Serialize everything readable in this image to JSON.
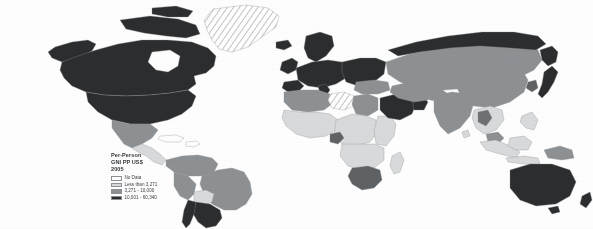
{
  "map": {
    "kind": "choropleth-world-map",
    "projection": "robinson",
    "background_color": "#fefefe",
    "border_color": "#8d9094",
    "legend": {
      "title_lines": [
        "Per-Person",
        "GNI PP US$",
        "2005"
      ],
      "entries": [
        {
          "label": "No Data",
          "color": "#ffffff",
          "pattern": "solid"
        },
        {
          "label": "Less than 3,271",
          "color": "#d9dadb",
          "pattern": "solid"
        },
        {
          "label": "3,271 - 10,000",
          "color": "#8e9194",
          "pattern": "solid"
        },
        {
          "label": "10,001 - 60,340",
          "color": "#2b2d2f",
          "pattern": "solid"
        }
      ]
    },
    "class_colors": {
      "no_data": "#ffffff",
      "low": "#d9dadb",
      "middle": "#8e9194",
      "high": "#2b2d2f",
      "hatched": "#ffffff"
    },
    "regions": [
      {
        "name": "greenland",
        "class": "hatched"
      },
      {
        "name": "canada",
        "class": "high"
      },
      {
        "name": "united-states",
        "class": "high"
      },
      {
        "name": "alaska",
        "class": "high"
      },
      {
        "name": "mexico",
        "class": "middle"
      },
      {
        "name": "central-america",
        "class": "low"
      },
      {
        "name": "caribbean",
        "class": "no_data"
      },
      {
        "name": "colombia-venezuela",
        "class": "middle"
      },
      {
        "name": "brazil",
        "class": "middle"
      },
      {
        "name": "bolivia",
        "class": "low"
      },
      {
        "name": "peru-ecuador",
        "class": "middle"
      },
      {
        "name": "argentina",
        "class": "high"
      },
      {
        "name": "chile",
        "class": "high"
      },
      {
        "name": "western-europe",
        "class": "high"
      },
      {
        "name": "scandinavia",
        "class": "high"
      },
      {
        "name": "eastern-europe",
        "class": "high"
      },
      {
        "name": "russia",
        "class": "middle"
      },
      {
        "name": "north-africa",
        "class": "middle"
      },
      {
        "name": "libya",
        "class": "hatched"
      },
      {
        "name": "west-africa",
        "class": "low"
      },
      {
        "name": "central-africa",
        "class": "low"
      },
      {
        "name": "east-africa",
        "class": "low"
      },
      {
        "name": "equatorial-guinea",
        "class": "middle"
      },
      {
        "name": "southern-africa",
        "class": "middle"
      },
      {
        "name": "madagascar",
        "class": "low"
      },
      {
        "name": "saudi-arabia",
        "class": "high"
      },
      {
        "name": "gulf-states",
        "class": "high"
      },
      {
        "name": "turkey-iran",
        "class": "middle"
      },
      {
        "name": "central-asia",
        "class": "middle"
      },
      {
        "name": "india",
        "class": "middle"
      },
      {
        "name": "china",
        "class": "middle"
      },
      {
        "name": "mongolia",
        "class": "middle"
      },
      {
        "name": "japan",
        "class": "high"
      },
      {
        "name": "korea",
        "class": "middle"
      },
      {
        "name": "southeast-asia",
        "class": "low"
      },
      {
        "name": "indonesia",
        "class": "low"
      },
      {
        "name": "malaysia",
        "class": "middle"
      },
      {
        "name": "philippines",
        "class": "low"
      },
      {
        "name": "australia",
        "class": "high"
      },
      {
        "name": "new-zealand",
        "class": "high"
      },
      {
        "name": "papua-new-guinea",
        "class": "low"
      }
    ]
  }
}
